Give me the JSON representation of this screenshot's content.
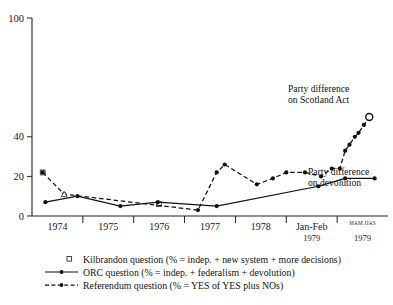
{
  "chart_data": {
    "type": "line",
    "title": "",
    "xlabel": "",
    "ylabel": "",
    "ylim": [
      0,
      100
    ],
    "yticks": [
      0,
      20,
      40,
      100
    ],
    "grid": false,
    "legend_position": "below",
    "xtick_labels": [
      "1974",
      "1975",
      "1976",
      "1977",
      "1978",
      "Jan-Feb",
      "MAM JJAS"
    ],
    "xtick_sublabels": [
      "",
      "",
      "",
      "",
      "",
      "1979",
      "1979"
    ],
    "series": [
      {
        "name": "Kilbrandon question (% = indep. + new system + more decisions)",
        "marker": "open-square",
        "style": "none",
        "points": [
          {
            "x": 1973.55,
            "y": 22
          },
          {
            "x": 1975.72,
            "y": 6
          }
        ]
      },
      {
        "name": "ORC question (% = indep. + federalism + devolution)",
        "marker": "filled-circle",
        "style": "solid",
        "points": [
          {
            "x": 1973.6,
            "y": 7
          },
          {
            "x": 1974.2,
            "y": 10
          },
          {
            "x": 1975.0,
            "y": 5
          },
          {
            "x": 1975.7,
            "y": 7
          },
          {
            "x": 1976.8,
            "y": 5
          },
          {
            "x": 1978.7,
            "y": 15
          },
          {
            "x": 1979.2,
            "y": 19
          },
          {
            "x": 1979.75,
            "y": 19
          }
        ]
      },
      {
        "name": "Referendum question (% = YES of YES plus NOs)",
        "marker": "filled-circle",
        "style": "dashed",
        "points": [
          {
            "x": 1973.55,
            "y": 22
          },
          {
            "x": 1973.95,
            "y": 11
          },
          {
            "x": 1976.45,
            "y": 3
          },
          {
            "x": 1976.8,
            "y": 22
          },
          {
            "x": 1976.95,
            "y": 26
          },
          {
            "x": 1977.55,
            "y": 16
          },
          {
            "x": 1977.85,
            "y": 19
          },
          {
            "x": 1978.1,
            "y": 22
          },
          {
            "x": 1978.45,
            "y": 22
          },
          {
            "x": 1978.75,
            "y": 20
          },
          {
            "x": 1978.95,
            "y": 24
          },
          {
            "x": 1979.1,
            "y": 24
          },
          {
            "x": 1979.2,
            "y": 33
          },
          {
            "x": 1979.28,
            "y": 36
          },
          {
            "x": 1979.38,
            "y": 40
          },
          {
            "x": 1979.45,
            "y": 42
          },
          {
            "x": 1979.55,
            "y": 46
          },
          {
            "x": 1979.65,
            "y": 50
          }
        ]
      }
    ],
    "annotations": [
      {
        "id": "scotland-act",
        "lines": [
          "Party difference",
          "on Scotland Act"
        ],
        "marker": "open-circle",
        "marker_point": {
          "x": 1979.65,
          "y": 50
        }
      },
      {
        "id": "devolution",
        "lines": [
          "Party difference",
          "on devolution"
        ],
        "marker": "none"
      }
    ]
  },
  "legend": {
    "entries": [
      {
        "key": "kilbrandon",
        "symbol": "open-square",
        "label": "Kilbrandon question (% = indep. + new system + more decisions)"
      },
      {
        "key": "orc",
        "symbol": "solid-line-dot",
        "label": "ORC question (% = indep. + federalism + devolution)"
      },
      {
        "key": "referendum",
        "symbol": "dashed-line-dot",
        "label": "Referendum question (% = YES of YES plus NOs)"
      }
    ]
  }
}
